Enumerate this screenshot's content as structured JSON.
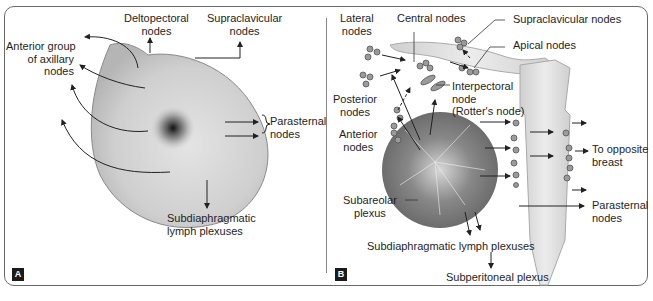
{
  "figure": {
    "panels": [
      {
        "id": "A",
        "badge": "A",
        "labels": {
          "deltopectoral": [
            "Deltopectoral",
            "nodes"
          ],
          "supraclavicular": [
            "Supraclavicular",
            "nodes"
          ],
          "anterior_axillary": [
            "Anterior group",
            "of axillary",
            "nodes"
          ],
          "parasternal": [
            "Parasternal",
            "nodes"
          ],
          "subdiaphragmatic": [
            "Subdiaphragmatic",
            "lymph plexuses"
          ]
        }
      },
      {
        "id": "B",
        "badge": "B",
        "labels": {
          "lateral": [
            "Lateral",
            "nodes"
          ],
          "central": "Central nodes",
          "supraclavicular": "Supraclavicular nodes",
          "apical": "Apical nodes",
          "interpectoral": [
            "Interpectoral",
            "node",
            "(Rotter's node)"
          ],
          "posterior": [
            "Posterior",
            "nodes"
          ],
          "anterior": [
            "Anterior",
            "nodes"
          ],
          "opposite_breast": [
            "To opposite",
            "breast"
          ],
          "subareolar": [
            "Subareolar",
            "plexus"
          ],
          "parasternal": [
            "Parasternal",
            "nodes"
          ],
          "subdiaphragmatic": "Subdiaphragmatic lymph plexuses",
          "subperitoneal": "Subperitoneal plexus"
        }
      }
    ],
    "colors": {
      "border": "#6a6a6a",
      "breast_fill": "#cfcfcf",
      "bone_fill": "#e2e2e2",
      "node_fill": "#9a9a9a",
      "badge_bg": "#1a1a1a"
    }
  }
}
